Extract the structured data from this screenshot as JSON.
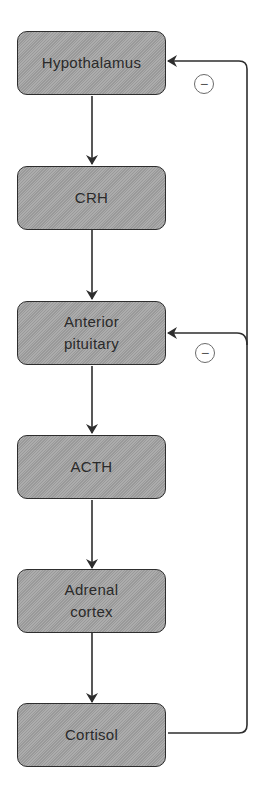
{
  "diagram": {
    "nodes": [
      {
        "id": "hypothalamus",
        "label": "Hypothalamus"
      },
      {
        "id": "crh",
        "label": "CRH"
      },
      {
        "id": "anterior_pituitary",
        "label": "Anterior\npituitary"
      },
      {
        "id": "acth",
        "label": "ACTH"
      },
      {
        "id": "adrenal_cortex",
        "label": "Adrenal\ncortex"
      },
      {
        "id": "cortisol",
        "label": "Cortisol"
      }
    ],
    "edges": [
      {
        "from": "hypothalamus",
        "to": "crh",
        "type": "stimulates"
      },
      {
        "from": "crh",
        "to": "anterior_pituitary",
        "type": "stimulates"
      },
      {
        "from": "anterior_pituitary",
        "to": "acth",
        "type": "stimulates"
      },
      {
        "from": "acth",
        "to": "adrenal_cortex",
        "type": "stimulates"
      },
      {
        "from": "adrenal_cortex",
        "to": "cortisol",
        "type": "stimulates"
      },
      {
        "from": "cortisol",
        "to": "hypothalamus",
        "type": "inhibits",
        "label": "−"
      },
      {
        "from": "cortisol",
        "to": "anterior_pituitary",
        "type": "inhibits",
        "label": "−"
      }
    ],
    "feedback_symbols": {
      "hypothalamus": "−",
      "anterior_pituitary": "−"
    },
    "colors": {
      "box_fill": "#a3a3a3",
      "box_border": "#2e2e2e",
      "line": "#2e2e2e",
      "text": "#2a2a2a"
    }
  }
}
